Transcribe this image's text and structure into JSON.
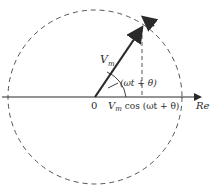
{
  "diagram": {
    "type": "phasor",
    "center": [
      95,
      97
    ],
    "radius": 87,
    "vector_tip": [
      142,
      27
    ],
    "axis_label": "Re",
    "origin_label": "0",
    "vector_label": {
      "main": "V",
      "sub": "m"
    },
    "angle_label": "(ωt + θ)",
    "projection_label": {
      "main": "V",
      "sub": "m",
      "rest": " cos (ωt + θ)"
    },
    "colors": {
      "ink": "#2a2a2a",
      "dash": "#555555"
    }
  }
}
